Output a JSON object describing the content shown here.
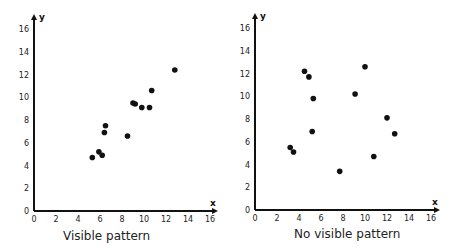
{
  "chart_data": [
    {
      "type": "scatter",
      "title": "",
      "caption": "Visible pattern",
      "xlabel": "x",
      "ylabel": "y",
      "xlim": [
        0,
        16
      ],
      "ylim": [
        0,
        16
      ],
      "xticks": [
        0,
        2,
        4,
        6,
        8,
        10,
        12,
        14,
        16
      ],
      "yticks": [
        0,
        2,
        4,
        6,
        8,
        10,
        12,
        14,
        16
      ],
      "grid": false,
      "legend": null,
      "points": [
        {
          "x": 5.3,
          "y": 4.7
        },
        {
          "x": 5.9,
          "y": 5.2
        },
        {
          "x": 6.2,
          "y": 4.9
        },
        {
          "x": 6.4,
          "y": 6.9
        },
        {
          "x": 6.5,
          "y": 7.5
        },
        {
          "x": 8.5,
          "y": 6.6
        },
        {
          "x": 9.0,
          "y": 9.5
        },
        {
          "x": 9.2,
          "y": 9.4
        },
        {
          "x": 9.8,
          "y": 9.1
        },
        {
          "x": 10.5,
          "y": 9.1
        },
        {
          "x": 10.7,
          "y": 10.6
        },
        {
          "x": 12.8,
          "y": 12.4
        }
      ]
    },
    {
      "type": "scatter",
      "title": "",
      "caption": "No visible pattern",
      "xlabel": "x",
      "ylabel": "y",
      "xlim": [
        0,
        16
      ],
      "ylim": [
        0,
        16
      ],
      "xticks": [
        0,
        2,
        4,
        6,
        8,
        10,
        12,
        14,
        16
      ],
      "yticks": [
        0,
        2,
        4,
        6,
        8,
        10,
        12,
        14,
        16
      ],
      "grid": false,
      "legend": null,
      "points": [
        {
          "x": 3.2,
          "y": 5.5
        },
        {
          "x": 3.5,
          "y": 5.1
        },
        {
          "x": 4.5,
          "y": 12.2
        },
        {
          "x": 4.9,
          "y": 11.7
        },
        {
          "x": 5.3,
          "y": 9.8
        },
        {
          "x": 5.2,
          "y": 6.9
        },
        {
          "x": 7.7,
          "y": 3.4
        },
        {
          "x": 9.1,
          "y": 10.2
        },
        {
          "x": 10.0,
          "y": 12.6
        },
        {
          "x": 10.8,
          "y": 4.7
        },
        {
          "x": 12.0,
          "y": 8.1
        },
        {
          "x": 12.7,
          "y": 6.7
        }
      ]
    }
  ],
  "layout": [
    {
      "origin_x": 34,
      "origin_y": 211,
      "px_per_x": 11.0,
      "px_per_y": 11.375,
      "axis_end_x": 218,
      "axis_end_y": 14,
      "caption_left": 63,
      "caption_top": 229
    },
    {
      "origin_x": 255,
      "origin_y": 210,
      "px_per_x": 11.0,
      "px_per_y": 11.375,
      "axis_end_x": 440,
      "axis_end_y": 13,
      "caption_left": 294,
      "caption_top": 227
    }
  ]
}
